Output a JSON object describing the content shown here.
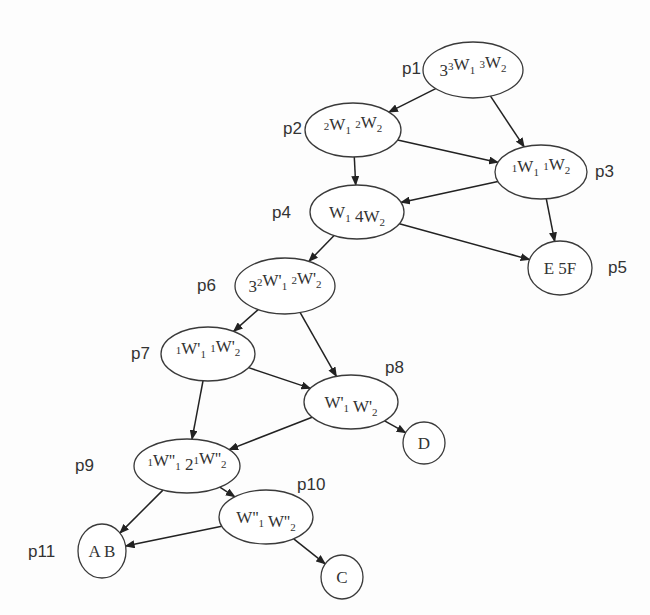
{
  "diagram": {
    "type": "directed-graph",
    "nodes": [
      {
        "id": "p1",
        "label": "p1",
        "content": "3³W₁ ³W₂",
        "text_parts": [
          [
            "3",
            ""
          ],
          [
            "3",
            "sup"
          ],
          [
            "W",
            ""
          ],
          [
            "1",
            "sub"
          ],
          [
            " ",
            ""
          ],
          [
            "3",
            "sup"
          ],
          [
            "W",
            ""
          ],
          [
            "2",
            "sub"
          ]
        ],
        "cx": 473,
        "cy": 70,
        "rx": 50,
        "ry": 28,
        "label_x": 402,
        "label_y": 74,
        "label_anchor": "start"
      },
      {
        "id": "p2",
        "label": "p2",
        "content": "²W₁ ²W₂",
        "text_parts": [
          [
            "2",
            "sup"
          ],
          [
            "W",
            ""
          ],
          [
            "1",
            "sub"
          ],
          [
            " ",
            ""
          ],
          [
            "2",
            "sup"
          ],
          [
            "W",
            ""
          ],
          [
            "2",
            "sub"
          ]
        ],
        "cx": 353,
        "cy": 130,
        "rx": 48,
        "ry": 27,
        "label_x": 283,
        "label_y": 134,
        "label_anchor": "start"
      },
      {
        "id": "p3",
        "label": "p3",
        "content": "¹W₁ ¹W₂",
        "text_parts": [
          [
            "1",
            "sup"
          ],
          [
            "W",
            ""
          ],
          [
            "1",
            "sub"
          ],
          [
            " ",
            ""
          ],
          [
            "1",
            "sup"
          ],
          [
            "W",
            ""
          ],
          [
            "2",
            "sub"
          ]
        ],
        "cx": 541,
        "cy": 172,
        "rx": 46,
        "ry": 27,
        "label_x": 595,
        "label_y": 177,
        "label_anchor": "start"
      },
      {
        "id": "p4",
        "label": "p4",
        "content": "W₁ 4W₂",
        "text_parts": [
          [
            "W",
            ""
          ],
          [
            "1",
            "sub"
          ],
          [
            " 4",
            ""
          ],
          [
            "W",
            ""
          ],
          [
            "2",
            "sub"
          ]
        ],
        "cx": 357,
        "cy": 212,
        "rx": 47,
        "ry": 27,
        "label_x": 272,
        "label_y": 218,
        "label_anchor": "start"
      },
      {
        "id": "p5",
        "label": "p5",
        "content": "E 5F",
        "text_parts": [
          [
            "E 5F",
            ""
          ]
        ],
        "cx": 560,
        "cy": 268,
        "rx": 32,
        "ry": 27,
        "label_x": 608,
        "label_y": 273,
        "label_anchor": "start"
      },
      {
        "id": "p6",
        "label": "p6",
        "content": "3²W'₁ ²W'₂",
        "text_parts": [
          [
            "3",
            ""
          ],
          [
            "2",
            "sup"
          ],
          [
            "W'",
            ""
          ],
          [
            "1",
            "sub"
          ],
          [
            " ",
            ""
          ],
          [
            "2",
            "sup"
          ],
          [
            "W'",
            ""
          ],
          [
            "2",
            "sub"
          ]
        ],
        "cx": 285,
        "cy": 286,
        "rx": 50,
        "ry": 28,
        "label_x": 197,
        "label_y": 291,
        "label_anchor": "start"
      },
      {
        "id": "p7",
        "label": "p7",
        "content": "¹W'₁ ¹W'₂",
        "text_parts": [
          [
            "1",
            "sup"
          ],
          [
            "W'",
            ""
          ],
          [
            "1",
            "sub"
          ],
          [
            " ",
            ""
          ],
          [
            "1",
            "sup"
          ],
          [
            "W'",
            ""
          ],
          [
            "2",
            "sub"
          ]
        ],
        "cx": 208,
        "cy": 354,
        "rx": 47,
        "ry": 27,
        "label_x": 131,
        "label_y": 359,
        "label_anchor": "start"
      },
      {
        "id": "p8",
        "label": "p8",
        "content": "W'₁ W'₂",
        "text_parts": [
          [
            "W'",
            ""
          ],
          [
            "1",
            "sub"
          ],
          [
            " ",
            ""
          ],
          [
            "W'",
            ""
          ],
          [
            "2",
            "sub"
          ]
        ],
        "cx": 351,
        "cy": 402,
        "rx": 47,
        "ry": 27,
        "label_x": 385,
        "label_y": 373,
        "label_anchor": "start"
      },
      {
        "id": "p9",
        "label": "p9",
        "content": "¹W''₁ 2¹W''₂",
        "text_parts": [
          [
            "1",
            "sup"
          ],
          [
            "W''",
            ""
          ],
          [
            "1",
            "sub"
          ],
          [
            " 2",
            ""
          ],
          [
            "1",
            "sup"
          ],
          [
            "W''",
            ""
          ],
          [
            "2",
            "sub"
          ]
        ],
        "cx": 187,
        "cy": 466,
        "rx": 53,
        "ry": 27,
        "label_x": 75,
        "label_y": 471,
        "label_anchor": "start"
      },
      {
        "id": "p10",
        "label": "p10",
        "content": "W''₁ W''₂",
        "text_parts": [
          [
            "W''",
            ""
          ],
          [
            "1",
            "sub"
          ],
          [
            " ",
            ""
          ],
          [
            "W''",
            ""
          ],
          [
            "2",
            "sub"
          ]
        ],
        "cx": 266,
        "cy": 517,
        "rx": 47,
        "ry": 27,
        "label_x": 297,
        "label_y": 490,
        "label_anchor": "start"
      },
      {
        "id": "D",
        "label": "",
        "content": "D",
        "text_parts": [
          [
            "D",
            ""
          ]
        ],
        "cx": 424,
        "cy": 443,
        "rx": 21,
        "ry": 21
      },
      {
        "id": "p11",
        "label": "p11",
        "content": "A B",
        "text_parts": [
          [
            "A B",
            ""
          ]
        ],
        "cx": 102,
        "cy": 551,
        "rx": 24,
        "ry": 27,
        "label_x": 28,
        "label_y": 557,
        "label_anchor": "start"
      },
      {
        "id": "C",
        "label": "",
        "content": "C",
        "text_parts": [
          [
            "C",
            ""
          ]
        ],
        "cx": 342,
        "cy": 577,
        "rx": 21,
        "ry": 22
      }
    ],
    "edges": [
      {
        "from": "p1",
        "to": "p2"
      },
      {
        "from": "p1",
        "to": "p3"
      },
      {
        "from": "p2",
        "to": "p3"
      },
      {
        "from": "p2",
        "to": "p4"
      },
      {
        "from": "p3",
        "to": "p4"
      },
      {
        "from": "p3",
        "to": "p5"
      },
      {
        "from": "p4",
        "to": "p5"
      },
      {
        "from": "p4",
        "to": "p6"
      },
      {
        "from": "p6",
        "to": "p7"
      },
      {
        "from": "p6",
        "to": "p8"
      },
      {
        "from": "p7",
        "to": "p8"
      },
      {
        "from": "p7",
        "to": "p9"
      },
      {
        "from": "p8",
        "to": "p9"
      },
      {
        "from": "p8",
        "to": "D"
      },
      {
        "from": "p9",
        "to": "p11"
      },
      {
        "from": "p9",
        "to": "p10"
      },
      {
        "from": "p10",
        "to": "p11"
      },
      {
        "from": "p10",
        "to": "C"
      }
    ],
    "colors": {
      "stroke": "#3a3a3a",
      "edge": "#222222",
      "text": "#333333",
      "background": "#fdfdfd"
    }
  }
}
